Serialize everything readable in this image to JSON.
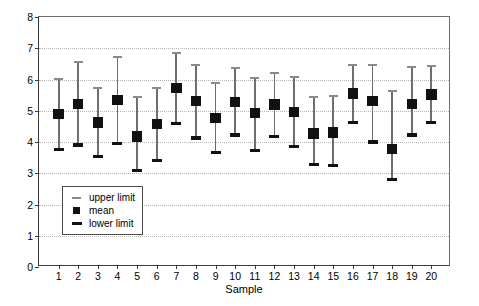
{
  "chart_data": {
    "type": "scatter",
    "title": "",
    "xlabel": "Sample",
    "ylabel": "",
    "xlim": [
      0,
      21
    ],
    "ylim": [
      0,
      8
    ],
    "grid": true,
    "legend_position": "inside-lower-left",
    "ytick_labels": [
      "0",
      "1",
      "2",
      "3",
      "4",
      "5",
      "6",
      "7",
      "8"
    ],
    "ytick_values": [
      0,
      1,
      2,
      3,
      4,
      5,
      6,
      7,
      8
    ],
    "categories": [
      "1",
      "2",
      "3",
      "4",
      "5",
      "6",
      "7",
      "8",
      "9",
      "10",
      "11",
      "12",
      "13",
      "14",
      "15",
      "16",
      "17",
      "18",
      "19",
      "20"
    ],
    "series": [
      {
        "name": "upper limit",
        "color": "#8a8a8a",
        "values": [
          6.02,
          6.55,
          5.72,
          6.72,
          5.45,
          5.72,
          6.85,
          6.45,
          5.88,
          6.37,
          6.05,
          6.22,
          6.08,
          5.45,
          5.48,
          6.45,
          6.45,
          5.62,
          6.4,
          6.42
        ]
      },
      {
        "name": "mean",
        "color": "#111111",
        "values": [
          4.89,
          5.22,
          4.63,
          5.35,
          4.18,
          4.57,
          5.72,
          5.32,
          4.77,
          5.28,
          4.93,
          5.2,
          4.96,
          4.27,
          4.3,
          5.55,
          5.32,
          3.78,
          5.22,
          5.52
        ]
      },
      {
        "name": "lower limit",
        "color": "#111111",
        "values": [
          3.76,
          3.91,
          3.54,
          3.96,
          3.09,
          3.4,
          4.6,
          4.13,
          3.66,
          4.22,
          3.72,
          4.17,
          3.85,
          3.28,
          3.25,
          4.62,
          4.0,
          2.8,
          4.22,
          4.62
        ]
      }
    ]
  },
  "legend": {
    "items": [
      {
        "label": "upper limit",
        "key": "upper-limit-key"
      },
      {
        "label": "mean",
        "key": "mean-key"
      },
      {
        "label": "lower limit",
        "key": "lower-limit-key"
      }
    ]
  }
}
